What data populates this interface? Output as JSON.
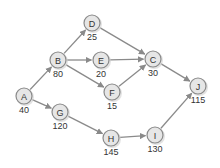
{
  "diagram": {
    "type": "network-graph",
    "node_radius": 8,
    "nodes": [
      {
        "id": "A",
        "label": "A",
        "value": "40",
        "x": 24,
        "y": 96
      },
      {
        "id": "B",
        "label": "B",
        "value": "80",
        "x": 58,
        "y": 60
      },
      {
        "id": "D",
        "label": "D",
        "value": "25",
        "x": 92,
        "y": 23
      },
      {
        "id": "E",
        "label": "E",
        "value": "20",
        "x": 101,
        "y": 60
      },
      {
        "id": "F",
        "label": "F",
        "value": "15",
        "x": 112,
        "y": 92
      },
      {
        "id": "C",
        "label": "C",
        "value": "30",
        "x": 153,
        "y": 59
      },
      {
        "id": "J",
        "label": "J",
        "value": "115",
        "x": 198,
        "y": 86
      },
      {
        "id": "G",
        "label": "G",
        "value": "120",
        "x": 60,
        "y": 112
      },
      {
        "id": "H",
        "label": "H",
        "value": "145",
        "x": 111,
        "y": 138
      },
      {
        "id": "I",
        "label": "I",
        "value": "130",
        "x": 155,
        "y": 135
      }
    ],
    "edges": [
      {
        "from": "A",
        "to": "B"
      },
      {
        "from": "A",
        "to": "G"
      },
      {
        "from": "B",
        "to": "D"
      },
      {
        "from": "B",
        "to": "E"
      },
      {
        "from": "B",
        "to": "F"
      },
      {
        "from": "D",
        "to": "C"
      },
      {
        "from": "E",
        "to": "C"
      },
      {
        "from": "F",
        "to": "C"
      },
      {
        "from": "C",
        "to": "J"
      },
      {
        "from": "G",
        "to": "H"
      },
      {
        "from": "H",
        "to": "I"
      },
      {
        "from": "I",
        "to": "J"
      }
    ],
    "colors": {
      "node_fill": "#e6e6e6",
      "node_stroke": "#8a8a8a",
      "edge": "#8a8a8a",
      "text": "#333333"
    }
  }
}
